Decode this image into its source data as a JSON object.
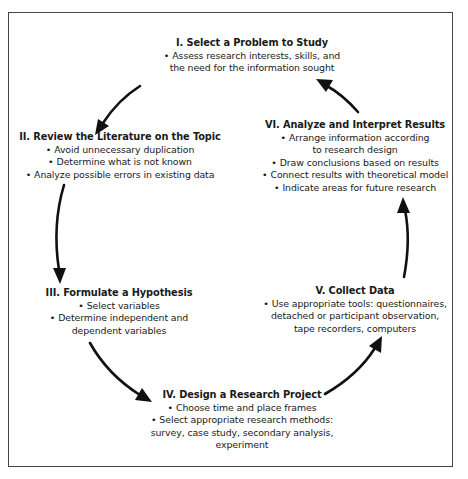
{
  "diagram": {
    "type": "cycle",
    "steps": [
      {
        "id": "I",
        "title": "I. Select a Problem to Study",
        "items": [
          {
            "text": "Assess research interests, skills, and",
            "bullet": true
          },
          {
            "text": "the need for the information sought",
            "bullet": false
          }
        ]
      },
      {
        "id": "II",
        "title": "II. Review the Literature on the Topic",
        "items": [
          {
            "text": "Avoid unnecessary duplication",
            "bullet": true
          },
          {
            "text": "Determine what is not known",
            "bullet": true
          },
          {
            "text": "Analyze possible errors in existing data",
            "bullet": true
          }
        ]
      },
      {
        "id": "III",
        "title": "III. Formulate a Hypothesis",
        "items": [
          {
            "text": "Select variables",
            "bullet": true
          },
          {
            "text": "Determine independent and",
            "bullet": true
          },
          {
            "text": "dependent variables",
            "bullet": false
          }
        ]
      },
      {
        "id": "IV",
        "title": "IV. Design a Research Project",
        "items": [
          {
            "text": "Choose time and place frames",
            "bullet": true
          },
          {
            "text": "Select appropriate research methods:",
            "bullet": true
          },
          {
            "text": "survey, case study, secondary analysis,",
            "bullet": false
          },
          {
            "text": "experiment",
            "bullet": false
          }
        ]
      },
      {
        "id": "V",
        "title": "V. Collect Data",
        "items": [
          {
            "text": "Use appropriate tools: questionnaires,",
            "bullet": true
          },
          {
            "text": "detached or participant observation,",
            "bullet": false
          },
          {
            "text": "tape recorders, computers",
            "bullet": false
          }
        ]
      },
      {
        "id": "VI",
        "title": "VI. Analyze and Interpret Results",
        "items": [
          {
            "text": "Arrange information according",
            "bullet": true
          },
          {
            "text": "to research design",
            "bullet": false
          },
          {
            "text": "Draw conclusions based on results",
            "bullet": true
          },
          {
            "text": "Connect results with theoretical model",
            "bullet": true
          },
          {
            "text": "Indicate areas for future research",
            "bullet": true
          }
        ]
      }
    ],
    "arrows": [
      {
        "from": "I",
        "to": "II"
      },
      {
        "from": "II",
        "to": "III"
      },
      {
        "from": "III",
        "to": "IV"
      },
      {
        "from": "IV",
        "to": "V"
      },
      {
        "from": "V",
        "to": "VI"
      },
      {
        "from": "VI",
        "to": "I"
      }
    ],
    "bullet_glyph": "•",
    "colors": {
      "text": "#1a1a1a",
      "arrow": "#111111",
      "border": "#444444",
      "background": "#ffffff"
    }
  }
}
